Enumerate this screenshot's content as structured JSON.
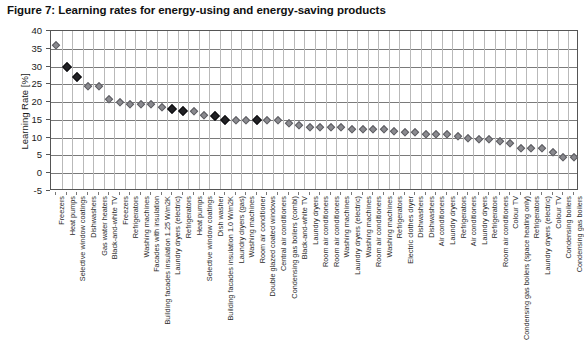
{
  "figure": {
    "title": "Figure 7: Learning rates for energy-using and energy-saving products"
  },
  "chart_data": {
    "type": "scatter",
    "title": "Figure 7: Learning rates for energy-using and energy-saving products",
    "xlabel": "",
    "ylabel": "Learning Rate [%]",
    "ylim": [
      -5,
      40
    ],
    "ytick_step": 5,
    "yticks": [
      40,
      35,
      30,
      25,
      20,
      15,
      10,
      5,
      0,
      -5
    ],
    "grid": true,
    "legend": "none",
    "marker_types": {
      "open": "light-grey open diamond",
      "filled": "dark filled diamond"
    },
    "colors": {
      "open_marker": "#8a8a8f",
      "filled_marker": "#222226",
      "gridline_major": "#7a7a7a",
      "gridline_minor": "#b9b9b9",
      "axis": "#555555",
      "text": "#1a1a1a"
    },
    "categories": [
      "Freezers",
      "Heat pumps",
      "Selective window coatings",
      "Dishwashers",
      "Gas water heaters",
      "Black-and-white TV",
      "Freezers",
      "Refrigerators",
      "Washing machines",
      "Facades with insulation",
      "Building facades insulation 1.25 W/m2K",
      "Laundry dryers (electric)",
      "Refrigerators",
      "Heat pumps",
      "Selective window coatings",
      "Dish washer",
      "Building facades insulation 1.0 W/m2K",
      "Laundry dryers (gas)",
      "Washing machines",
      "Room air conditioner",
      "Double glazed coated windows",
      "Central air conditioners",
      "Condensing gas boilers (combi)",
      "Black-and-white TV",
      "Laundry dryers",
      "Room air conditioners",
      "Room air conditioners",
      "Washing machines",
      "Laundry dryers (electric)",
      "Washing machines",
      "Room air conditioners",
      "Washing machines",
      "Refrigerators",
      "Electric clothes dryer",
      "Dishwashers",
      "Dishwashers",
      "Air conditioners",
      "Laundry dryers",
      "Refrigerators",
      "Air conditioners",
      "Laundry dryers",
      "Refrigerators",
      "Room air conditioners",
      "Colour TV",
      "Condensing gas boilers (space heating only)",
      "Refrigerators",
      "Laundry dryers (electric)",
      "Colour TV",
      "Condensing boilers",
      "Condensing gas boilers"
    ],
    "values": [
      36,
      30,
      27,
      24.5,
      24.5,
      21,
      20,
      19.5,
      19.5,
      19.5,
      18.5,
      18,
      17.5,
      17.5,
      16.5,
      16,
      15,
      15,
      15,
      15,
      15,
      15,
      14,
      13.5,
      13,
      13,
      13,
      13,
      12.5,
      12.5,
      12.5,
      12.5,
      12,
      11.5,
      11.5,
      11,
      11,
      11,
      10.5,
      10,
      9.5,
      9.5,
      9,
      8.5,
      7,
      7,
      7,
      6,
      4.5,
      4.5
    ],
    "marker_style": [
      "open",
      "filled",
      "filled",
      "open",
      "open",
      "open",
      "open",
      "open",
      "open",
      "open",
      "open",
      "filled",
      "filled",
      "open",
      "open",
      "filled",
      "filled",
      "open",
      "open",
      "filled",
      "open",
      "open",
      "open",
      "open",
      "open",
      "open",
      "open",
      "open",
      "open",
      "open",
      "open",
      "open",
      "open",
      "open",
      "open",
      "open",
      "open",
      "open",
      "open",
      "open",
      "open",
      "open",
      "open",
      "open",
      "open",
      "open",
      "open",
      "open",
      "open",
      "open"
    ]
  }
}
